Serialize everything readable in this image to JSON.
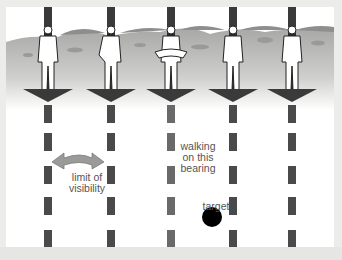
{
  "diagram": {
    "labels": {
      "limit_of_visibility": [
        "limit of",
        "visibility"
      ],
      "walking_bearing": [
        "walking",
        "on this",
        "bearing"
      ],
      "target": "target"
    },
    "columns": [
      {
        "x": 48,
        "figure": "walker-standing"
      },
      {
        "x": 111,
        "figure": "walker-arm-out"
      },
      {
        "x": 171,
        "figure": "walker-holding-map"
      },
      {
        "x": 233,
        "figure": "walker-standing"
      },
      {
        "x": 292,
        "figure": "walker-holding-item"
      }
    ],
    "colors": {
      "arrow": "#3a3a3a",
      "dash_block": "#4a4a4a",
      "dash_block_center": "#6a6a6a",
      "visibility_arrow": "#9a9a98",
      "target": "#000000",
      "terrain": "#b8b8b6",
      "hills": "#8e8e8c",
      "label_text": "#555555"
    }
  }
}
